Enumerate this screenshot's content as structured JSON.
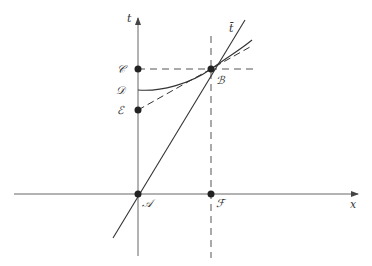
{
  "diagram": {
    "axes": {
      "x_label": "x",
      "y_label": "t"
    },
    "points": [
      {
        "id": "A",
        "label": "𝒜",
        "x": 138,
        "y": 194
      },
      {
        "id": "B",
        "label": "ℬ",
        "x": 211,
        "y": 69
      },
      {
        "id": "C",
        "label": "𝒞",
        "x": 138,
        "y": 69
      },
      {
        "id": "D",
        "label": "𝒟",
        "x": 138,
        "y": 90
      },
      {
        "id": "E",
        "label": "ℰ",
        "x": 138,
        "y": 110
      },
      {
        "id": "F",
        "label": "ℱ",
        "x": 211,
        "y": 194
      }
    ],
    "lines": {
      "t_bar_label": "t̄",
      "steep_line": "line through A and B (t̄ axis)",
      "curve": "curve from D through B",
      "tangent": "dashed tangent from E through B"
    },
    "colors": {
      "stroke": "#333333",
      "axis": "#666666",
      "background": "#ffffff"
    }
  }
}
